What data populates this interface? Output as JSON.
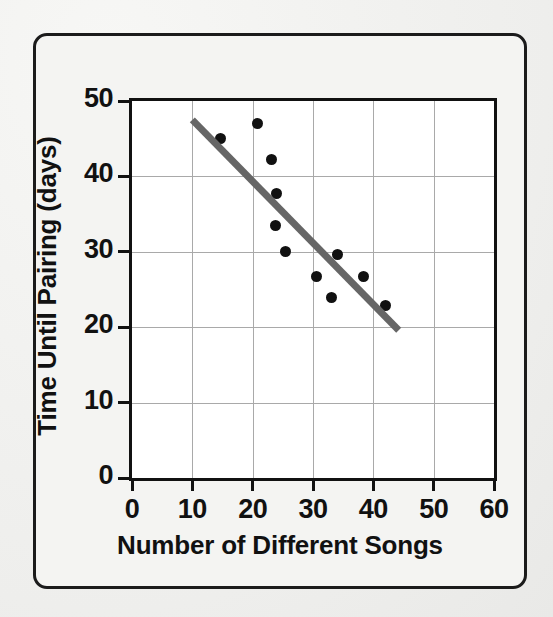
{
  "figure": {
    "kind": "scatter-plot-with-trend-line",
    "border_color": "#1b1b1b",
    "page_background": "#f2f2f0",
    "plot_background": "#ffffff"
  },
  "chart_data": {
    "type": "scatter",
    "title": "",
    "xlabel": "Number of Different Songs",
    "ylabel": "Time Until Pairing (days)",
    "xlim": [
      0,
      60
    ],
    "ylim": [
      0,
      50
    ],
    "xticks": [
      0,
      10,
      20,
      30,
      40,
      50,
      60
    ],
    "yticks": [
      0,
      10,
      20,
      30,
      40,
      50
    ],
    "xtick_labels": [
      "0",
      "10",
      "20",
      "30",
      "40",
      "50",
      "60"
    ],
    "ytick_labels": [
      "0",
      "10",
      "20",
      "30",
      "40",
      "50"
    ],
    "grid": true,
    "grid_color": "#a9a9a9",
    "legend": null,
    "points": [
      {
        "x": 14.7,
        "y": 45.0
      },
      {
        "x": 20.8,
        "y": 47.0
      },
      {
        "x": 23.2,
        "y": 42.3
      },
      {
        "x": 24.0,
        "y": 37.7
      },
      {
        "x": 23.8,
        "y": 33.5
      },
      {
        "x": 25.4,
        "y": 30.0
      },
      {
        "x": 30.6,
        "y": 26.7
      },
      {
        "x": 33.0,
        "y": 24.0
      },
      {
        "x": 34.0,
        "y": 29.7
      },
      {
        "x": 38.3,
        "y": 26.7
      },
      {
        "x": 42.0,
        "y": 22.9
      }
    ],
    "point_color": "#111111",
    "point_size_px": 11,
    "trend_line": {
      "x0": 10.0,
      "y0": 47.5,
      "x1": 44.2,
      "y1": 19.6,
      "color": "#666666",
      "width_px": 7
    }
  },
  "axis_titles": {
    "x": "Number of Different Songs",
    "y": "Time Until Pairing (days)"
  }
}
